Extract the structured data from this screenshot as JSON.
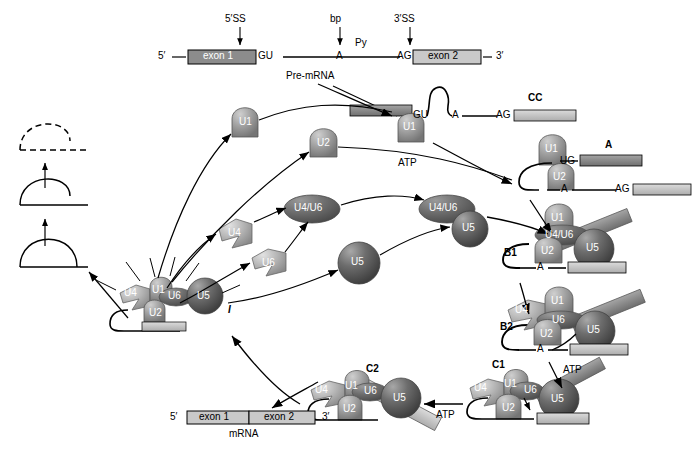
{
  "figure": {
    "type": "pathway-diagram"
  },
  "colors": {
    "exon1_fill": "#8c8c8c",
    "exon2_fill": "#c9c9c9",
    "snrnp_light": "#b4b4b4",
    "snrnp_mid": "#9a9a9a",
    "snrnp_dark": "#6b6b6b",
    "u5_dark": "#5d5d5d",
    "line": "#000000",
    "bar_light": "#bfbfbf"
  },
  "premrna": {
    "five_prime": "5′",
    "three_prime": "3′",
    "exon1": "exon 1",
    "exon2": "exon 2",
    "gu": "GU",
    "branch_a": "A",
    "ag": "AG",
    "py": "Py",
    "caption": "Pre-mRNA",
    "annot_5ss": "5′SS",
    "annot_bp": "bp",
    "annot_3ss": "3′SS"
  },
  "snrnps": {
    "u1": "U1",
    "u2": "U2",
    "u4": "U4",
    "u5": "U5",
    "u6": "U6",
    "u4u6": "U4/U6"
  },
  "complexes": {
    "cc": "CC",
    "a": "A",
    "b1": "B1",
    "b2": "B2",
    "c1": "C1",
    "c2": "C2",
    "i": "I"
  },
  "energy": {
    "atp1": "ATP",
    "atp2": "ATP",
    "atp3": "ATP"
  },
  "residues": {
    "gu": "GU",
    "ug": "UG",
    "ag": "AG",
    "a": "A"
  },
  "mrna": {
    "five_prime": "5′",
    "three_prime": "3′",
    "exon1": "exon 1",
    "exon2": "exon 2",
    "caption": "mRNA"
  },
  "intron_products": {
    "lariat_closed": "lariat intron",
    "lariat_open": "linearized intron",
    "degraded": "degraded intron"
  }
}
